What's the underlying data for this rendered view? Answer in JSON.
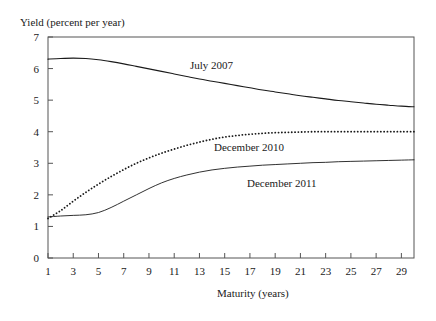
{
  "chart_data": {
    "type": "line",
    "title": "",
    "ylabel": "Yield (percent per year)",
    "xlabel": "Maturity (years)",
    "xlim": [
      1,
      30
    ],
    "ylim": [
      0,
      7
    ],
    "grid": false,
    "legend_position": "inline-annotations",
    "ytick_labels": [
      "0",
      "1",
      "2",
      "3",
      "4",
      "5",
      "6",
      "7"
    ],
    "yticks": [
      0,
      1,
      2,
      3,
      4,
      5,
      6,
      7
    ],
    "xtick_labels": [
      "1",
      "3",
      "5",
      "7",
      "9",
      "11",
      "13",
      "15",
      "17",
      "19",
      "21",
      "23",
      "25",
      "27",
      "29"
    ],
    "xticks": [
      1,
      3,
      5,
      7,
      9,
      11,
      13,
      15,
      17,
      19,
      21,
      23,
      25,
      27,
      29
    ],
    "x": [
      1,
      2,
      3,
      4,
      5,
      6,
      7,
      8,
      9,
      10,
      11,
      12,
      13,
      14,
      15,
      16,
      17,
      18,
      19,
      20,
      21,
      22,
      23,
      24,
      25,
      26,
      27,
      28,
      29,
      30
    ],
    "series": [
      {
        "name": "July 2007",
        "style": "solid",
        "color": "#1a1a1a",
        "values": [
          6.3,
          6.32,
          6.33,
          6.32,
          6.28,
          6.22,
          6.15,
          6.07,
          5.99,
          5.91,
          5.83,
          5.75,
          5.67,
          5.6,
          5.53,
          5.46,
          5.39,
          5.32,
          5.26,
          5.2,
          5.14,
          5.09,
          5.04,
          4.99,
          4.95,
          4.91,
          4.87,
          4.84,
          4.81,
          4.79
        ]
      },
      {
        "name": "December 2010",
        "style": "dotted",
        "color": "#1a1a1a",
        "values": [
          1.25,
          1.5,
          1.8,
          2.08,
          2.34,
          2.58,
          2.8,
          3.0,
          3.17,
          3.32,
          3.45,
          3.57,
          3.67,
          3.76,
          3.83,
          3.88,
          3.92,
          3.95,
          3.97,
          3.98,
          3.99,
          4.0,
          4.0,
          4.0,
          4.0,
          4.0,
          4.0,
          4.0,
          4.0,
          4.0
        ]
      },
      {
        "name": "December 2011",
        "style": "solid-thin",
        "color": "#1a1a1a",
        "values": [
          1.3,
          1.33,
          1.35,
          1.37,
          1.44,
          1.6,
          1.8,
          2.0,
          2.2,
          2.38,
          2.52,
          2.63,
          2.72,
          2.79,
          2.84,
          2.88,
          2.91,
          2.94,
          2.96,
          2.98,
          3.0,
          3.02,
          3.03,
          3.05,
          3.06,
          3.07,
          3.08,
          3.09,
          3.1,
          3.11
        ]
      }
    ]
  }
}
